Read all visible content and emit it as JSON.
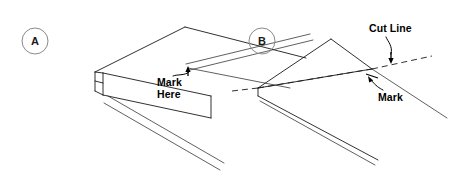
{
  "figure": {
    "type": "technical-line-diagram",
    "background_color": "#ffffff",
    "line_color": "#1a1a1a",
    "panel_label_color": "#8a8a8a"
  },
  "panels": [
    {
      "id": "A",
      "letter": "A",
      "callouts": [
        {
          "name": "mark-here",
          "line1": "Mark",
          "line2": "Here",
          "full_text": "Mark Here"
        }
      ]
    },
    {
      "id": "B",
      "letter": "B",
      "callouts": [
        {
          "name": "cut-line",
          "line1": "Cut Line",
          "line2": "",
          "full_text": "Cut Line"
        },
        {
          "name": "mark",
          "line1": "Mark",
          "line2": "",
          "full_text": "Mark"
        }
      ]
    }
  ]
}
